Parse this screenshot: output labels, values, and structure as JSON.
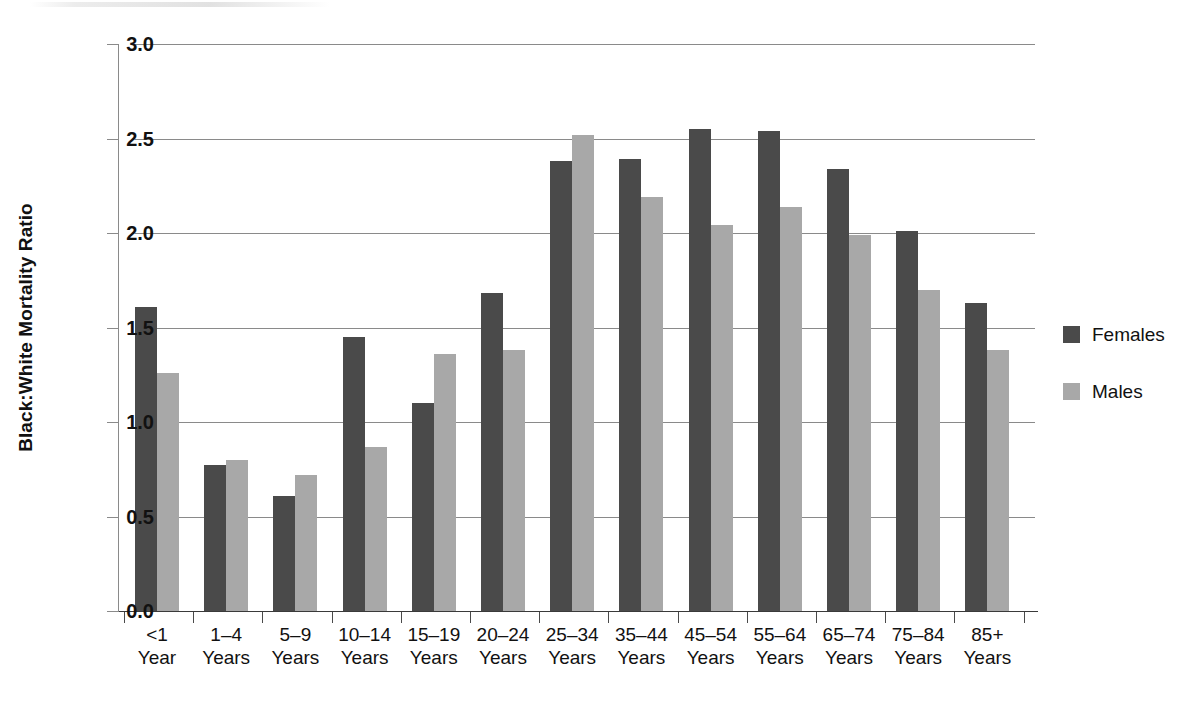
{
  "chart_data": {
    "type": "bar",
    "title": "",
    "xlabel": "",
    "ylabel": "Black:White Mortality Ratio",
    "ylim": [
      0.0,
      3.0
    ],
    "ytick_labels": [
      "0.0",
      "0.5",
      "1.0",
      "1.5",
      "2.0",
      "2.5",
      "3.0"
    ],
    "ytick_values": [
      0.0,
      0.5,
      1.0,
      1.5,
      2.0,
      2.5,
      3.0
    ],
    "grid": true,
    "legend_position": "right",
    "categories": [
      "<1 Year",
      "1–4 Years",
      "5–9 Years",
      "10–14 Years",
      "15–19 Years",
      "20–24 Years",
      "25–34 Years",
      "35–44 Years",
      "45–54 Years",
      "55–64 Years",
      "65–74 Years",
      "75–84 Years",
      "85+ Years"
    ],
    "category_lines": [
      [
        "<1",
        "Year"
      ],
      [
        "1–4",
        "Years"
      ],
      [
        "5–9",
        "Years"
      ],
      [
        "10–14",
        "Years"
      ],
      [
        "15–19",
        "Years"
      ],
      [
        "20–24",
        "Years"
      ],
      [
        "25–34",
        "Years"
      ],
      [
        "35–44",
        "Years"
      ],
      [
        "45–54",
        "Years"
      ],
      [
        "55–64",
        "Years"
      ],
      [
        "65–74",
        "Years"
      ],
      [
        "75–84",
        "Years"
      ],
      [
        "85+",
        "Years"
      ]
    ],
    "series": [
      {
        "name": "Females",
        "color": "#4a4a4a",
        "values": [
          1.61,
          0.77,
          0.61,
          1.45,
          1.1,
          1.68,
          2.38,
          2.39,
          2.55,
          2.54,
          2.34,
          2.01,
          1.63
        ]
      },
      {
        "name": "Males",
        "color": "#a8a8a8",
        "values": [
          1.26,
          0.8,
          0.72,
          0.87,
          1.36,
          1.38,
          2.52,
          2.19,
          2.04,
          2.14,
          1.99,
          1.7,
          1.38
        ]
      }
    ]
  },
  "legend": {
    "entries": [
      {
        "label": "Females",
        "color": "#4a4a4a"
      },
      {
        "label": "Males",
        "color": "#a8a8a8"
      }
    ]
  }
}
